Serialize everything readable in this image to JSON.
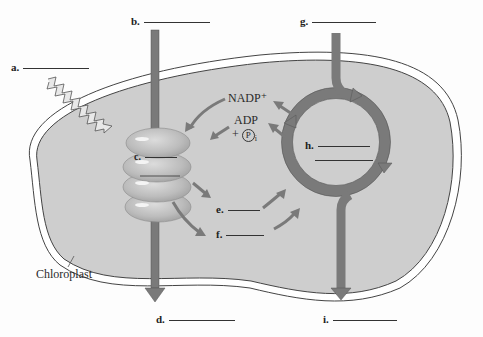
{
  "diagram": {
    "structure_label": "Chloroplast",
    "molecules": {
      "nadp": "NADP⁺",
      "adp": "ADP",
      "pi_prefix": "+",
      "pi": "P",
      "pi_sub": "i"
    },
    "blanks": [
      {
        "id": "a",
        "label": "a."
      },
      {
        "id": "b",
        "label": "b."
      },
      {
        "id": "c",
        "label": "c."
      },
      {
        "id": "d",
        "label": "d."
      },
      {
        "id": "e",
        "label": "e."
      },
      {
        "id": "f",
        "label": "f."
      },
      {
        "id": "g",
        "label": "g."
      },
      {
        "id": "h",
        "label": "h."
      },
      {
        "id": "i",
        "label": "i."
      }
    ],
    "colors": {
      "stroma": "#cfcfcf",
      "arrow": "#777777",
      "thylakoid": "#bdbdbd",
      "membrane_line": "#555555"
    }
  }
}
